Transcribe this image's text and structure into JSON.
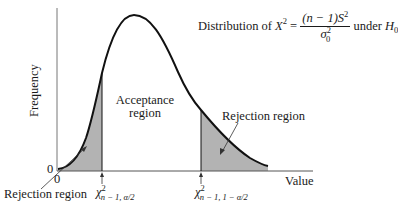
{
  "diagram": {
    "title_prefix": "Distribution of ",
    "stat_var": "X",
    "stat_sup": "2",
    "equals": " = ",
    "numerator": "(n − 1)S",
    "numerator_sup": "2",
    "denominator": "σ",
    "denominator_sup": "2",
    "denominator_sub": "0",
    "title_suffix": " under ",
    "hypothesis": "H",
    "hypothesis_sub": "0",
    "y_axis_label": "Frequency",
    "x_axis_label": "Value",
    "y_origin_label": "0",
    "x_origin_label": "0",
    "acceptance_line1": "Acceptance",
    "acceptance_line2": "region",
    "rejection_left": "Rejection region",
    "rejection_right": "Rejection region",
    "crit_left_sym": "χ",
    "crit_left_sup": "2",
    "crit_left_sub": "n − 1, α/2",
    "crit_right_sym": "χ",
    "crit_right_sup": "2",
    "crit_right_sub": "n − 1, 1 − α/2",
    "colors": {
      "curve": "#111111",
      "shade": "#b3b3b3",
      "axis": "#777777"
    }
  }
}
